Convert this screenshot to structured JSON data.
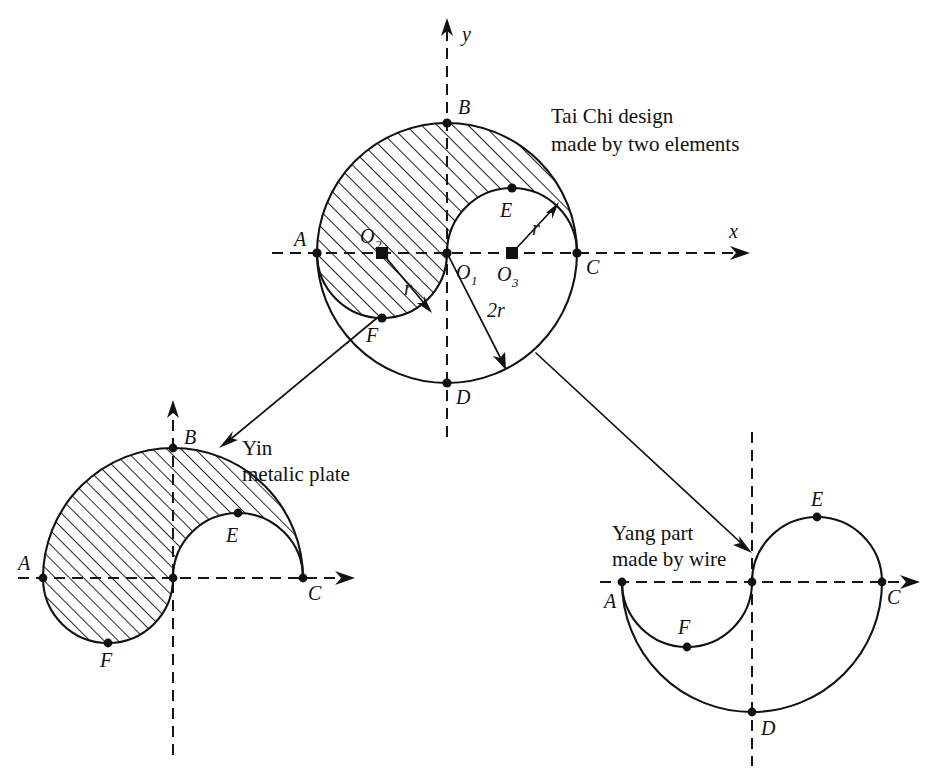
{
  "figure": {
    "geometry": {
      "big_radius_label": "2r",
      "small_radius_label": "r",
      "notes": "Big circle radius 2r centered at O1; two small circles radius r centered at O2 and O3 on the x axis."
    },
    "panels": [
      {
        "id": "main",
        "caption_lines": [
          "Tai Chi design",
          "made by two elements"
        ],
        "axis_x_label": "x",
        "axis_y_label": "y",
        "points": [
          {
            "label": "A",
            "sub": ""
          },
          {
            "label": "B",
            "sub": ""
          },
          {
            "label": "C",
            "sub": ""
          },
          {
            "label": "D",
            "sub": ""
          },
          {
            "label": "E",
            "sub": ""
          },
          {
            "label": "F",
            "sub": ""
          },
          {
            "label": "O",
            "sub": "1"
          },
          {
            "label": "O",
            "sub": "2"
          },
          {
            "label": "O",
            "sub": "3"
          }
        ],
        "dimension_labels": [
          "r",
          "r",
          "2r"
        ]
      },
      {
        "id": "yin",
        "caption_lines": [
          "Yin",
          "metalic plate"
        ],
        "points": [
          {
            "label": "A",
            "sub": ""
          },
          {
            "label": "B",
            "sub": ""
          },
          {
            "label": "C",
            "sub": ""
          },
          {
            "label": "E",
            "sub": ""
          },
          {
            "label": "F",
            "sub": ""
          }
        ]
      },
      {
        "id": "yang",
        "caption_lines": [
          "Yang part",
          "made by wire"
        ],
        "points": [
          {
            "label": "A",
            "sub": ""
          },
          {
            "label": "C",
            "sub": ""
          },
          {
            "label": "D",
            "sub": ""
          },
          {
            "label": "E",
            "sub": ""
          },
          {
            "label": "F",
            "sub": ""
          }
        ]
      }
    ]
  },
  "labels": {
    "main": {
      "A": "A",
      "B": "B",
      "C": "C",
      "D": "D",
      "E": "E",
      "F": "F",
      "O1": "O",
      "O1sub": "1",
      "O2": "O",
      "O2sub": "2",
      "O3": "O",
      "O3sub": "3",
      "r_left": "r",
      "r_right": "r",
      "two_r": "2r",
      "axis_x": "x",
      "axis_y": "y",
      "caption_line1": "Tai Chi design",
      "caption_line2": "made by two elements"
    },
    "yin": {
      "A": "A",
      "B": "B",
      "C": "C",
      "E": "E",
      "F": "F",
      "caption_line1": "Yin",
      "caption_line2": "metalic plate"
    },
    "yang": {
      "A": "A",
      "C": "C",
      "D": "D",
      "E": "E",
      "F": "F",
      "caption_line1": "Yang part",
      "caption_line2": "made by wire"
    }
  },
  "colors": {
    "ink": "#121212",
    "background": "#ffffff",
    "hatch": "#121212"
  }
}
